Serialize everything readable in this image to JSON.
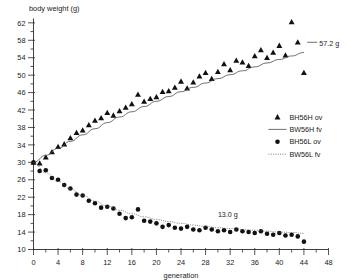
{
  "chart_data": {
    "type": "scatter",
    "title": "",
    "ylabel": "body weight (g)",
    "xlabel": "generation",
    "xlim": [
      0,
      48
    ],
    "ylim": [
      10,
      63
    ],
    "xticks": [
      0,
      4,
      8,
      12,
      16,
      20,
      24,
      28,
      32,
      36,
      40,
      44,
      48
    ],
    "yticks": [
      10,
      14,
      18,
      22,
      26,
      30,
      34,
      38,
      42,
      46,
      50,
      54,
      58,
      62
    ],
    "xtick_labels": [
      "0",
      "4",
      "8",
      "12",
      "16",
      "20",
      "24",
      "28",
      "32",
      "36",
      "40",
      "44",
      "48"
    ],
    "ytick_labels": [
      "10",
      "14",
      "18",
      "22",
      "26",
      "30",
      "34",
      "38",
      "42",
      "46",
      "50",
      "54",
      "58",
      "62"
    ],
    "xminor_step": 2,
    "yminor_step": 2,
    "grid": false,
    "legend_position": "center-right",
    "marker_color": "#111111",
    "line_color": "#4a4a4a",
    "series": [
      {
        "name": "BH56H ov",
        "kind": "scatter",
        "marker": "triangle",
        "x": [
          0,
          1,
          2,
          3,
          4,
          5,
          6,
          7,
          8,
          9,
          10,
          11,
          12,
          13,
          14,
          15,
          16,
          17,
          18,
          19,
          20,
          21,
          22,
          23,
          24,
          25,
          26,
          27,
          28,
          29,
          30,
          31,
          32,
          33,
          34,
          35,
          36,
          37,
          38,
          39,
          40,
          41,
          42,
          43,
          44
        ],
        "y": [
          30.0,
          29.8,
          31.2,
          32.4,
          33.6,
          34.2,
          35.6,
          36.8,
          37.4,
          38.6,
          39.6,
          40.2,
          41.4,
          40.8,
          41.8,
          42.6,
          43.4,
          45.6,
          44.0,
          44.6,
          45.0,
          46.2,
          46.4,
          47.2,
          48.6,
          47.0,
          48.4,
          49.8,
          50.6,
          49.2,
          50.8,
          52.6,
          51.2,
          53.4,
          53.0,
          52.2,
          54.4,
          55.8,
          54.0,
          55.2,
          56.8,
          54.6,
          62.2,
          57.6,
          50.6
        ]
      },
      {
        "name": "BW56H fv",
        "kind": "line",
        "style": "solid",
        "x": [
          0,
          2,
          4,
          6,
          8,
          10,
          12,
          14,
          16,
          18,
          20,
          22,
          24,
          26,
          28,
          30,
          32,
          34,
          36,
          38,
          40,
          42,
          44
        ],
        "y": [
          30.0,
          31.6,
          33.2,
          34.8,
          36.3,
          37.7,
          39.1,
          40.4,
          41.6,
          42.8,
          44.0,
          45.1,
          46.2,
          47.2,
          48.2,
          49.2,
          50.1,
          51.0,
          51.9,
          52.8,
          53.6,
          54.4,
          55.2
        ]
      },
      {
        "name": "BH56L ov",
        "kind": "scatter",
        "marker": "circle",
        "x": [
          0,
          1,
          2,
          3,
          4,
          5,
          6,
          7,
          8,
          9,
          10,
          11,
          12,
          13,
          14,
          15,
          16,
          17,
          18,
          19,
          20,
          21,
          22,
          23,
          24,
          25,
          26,
          27,
          28,
          29,
          30,
          31,
          32,
          33,
          34,
          35,
          36,
          37,
          38,
          39,
          40,
          41,
          42,
          43,
          44
        ],
        "y": [
          30.0,
          28.0,
          28.2,
          26.4,
          26.0,
          24.8,
          24.0,
          22.6,
          22.4,
          21.2,
          20.6,
          19.6,
          19.8,
          19.4,
          18.2,
          17.2,
          17.4,
          19.2,
          16.6,
          16.4,
          16.0,
          15.2,
          15.6,
          15.0,
          14.8,
          15.2,
          14.6,
          14.4,
          15.0,
          14.6,
          14.2,
          14.4,
          14.0,
          14.6,
          14.2,
          14.0,
          13.8,
          14.2,
          13.6,
          13.4,
          13.8,
          13.2,
          13.4,
          13.0,
          11.8
        ]
      },
      {
        "name": "BW56L fv",
        "kind": "line",
        "style": "dotted",
        "x": [
          0,
          2,
          4,
          6,
          8,
          10,
          12,
          14,
          16,
          18,
          20,
          22,
          24,
          26,
          28,
          30,
          32,
          34,
          36,
          38,
          40,
          42,
          44
        ],
        "y": [
          30.0,
          27.6,
          25.6,
          23.9,
          22.4,
          21.1,
          20.0,
          19.0,
          18.2,
          17.5,
          16.9,
          16.4,
          16.0,
          15.6,
          15.3,
          15.0,
          14.8,
          14.6,
          14.4,
          14.2,
          14.0,
          13.9,
          13.7
        ]
      }
    ],
    "annotations": [
      {
        "text": "57.2 g",
        "x": 46.5,
        "y": 57.2,
        "series": "BW56H fv",
        "leader": true
      },
      {
        "text": "13.0 g",
        "x": 30.0,
        "y": 18.0,
        "series": "BW56L fv",
        "leader": false
      }
    ]
  },
  "legend": {
    "items": [
      {
        "label": "BH56H ov",
        "glyph": "triangle-marker-icon"
      },
      {
        "label": "BW56H fv",
        "glyph": "solid-line-icon"
      },
      {
        "label": "BH56L ov",
        "glyph": "circle-marker-icon"
      },
      {
        "label": "BW56L fv",
        "glyph": "dotted-line-icon"
      }
    ]
  }
}
